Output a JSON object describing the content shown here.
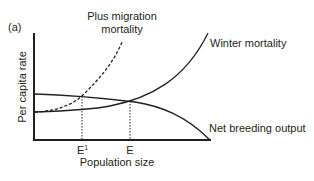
{
  "figure": {
    "panel_label": "(a)",
    "ylabel": "Per capita rate",
    "xlabel": "Population size",
    "curves": {
      "migration": {
        "label_line1": "Plus migration",
        "label_line2": "mortality",
        "style": "dashed"
      },
      "winter": {
        "label": "Winter mortality",
        "style": "solid"
      },
      "breeding": {
        "label": "Net breeding output",
        "style": "solid"
      }
    },
    "markers": {
      "e1": {
        "label": "E",
        "superscript": "1"
      },
      "e": {
        "label": "E"
      }
    },
    "colors": {
      "ink": "#231f20",
      "background": "#ffffff"
    }
  }
}
